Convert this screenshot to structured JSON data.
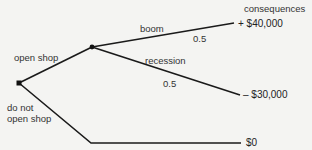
{
  "diagram": {
    "type": "decision-tree",
    "header": "consequences",
    "nodes": {
      "decision": {
        "kind": "decision-square"
      },
      "chance": {
        "kind": "chance-dot"
      }
    },
    "branches": {
      "open_shop": {
        "label": "open shop"
      },
      "do_not_open": {
        "label_line1": "do not",
        "label_line2": "open shop"
      },
      "boom": {
        "label": "boom",
        "probability": "0.5"
      },
      "recession": {
        "label": "recession",
        "probability": "0.5"
      }
    },
    "outcomes": {
      "boom": "+ $40,000",
      "recession": "– $30,000",
      "do_not_open": "$0"
    },
    "colors": {
      "line": "#1a1a1a",
      "text": "#333333",
      "background": "#f4f4f2"
    }
  }
}
